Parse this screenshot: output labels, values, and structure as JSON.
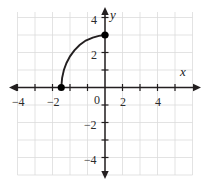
{
  "figure": {
    "name": "coordinate-plane-graph",
    "width": 210,
    "height": 184,
    "background": "#ffffff",
    "axis_color": "#231f20",
    "grid_color": "#d9d9d9",
    "curve_color": "#231f20",
    "point_color": "#000000"
  },
  "axes": {
    "x_label": "x",
    "y_label": "y",
    "x_ticks": [
      {
        "value": -4,
        "label": "−4"
      },
      {
        "value": -2,
        "label": "−2"
      },
      {
        "value": 2,
        "label": "2"
      },
      {
        "value": 4,
        "label": "4"
      }
    ],
    "y_ticks": [
      {
        "value": 4,
        "label": "4"
      },
      {
        "value": 2,
        "label": "2"
      },
      {
        "value": -2,
        "label": "−2"
      },
      {
        "value": -4,
        "label": "−4"
      }
    ],
    "origin_label": "0"
  },
  "chart_data": {
    "type": "line",
    "title": "",
    "xlabel": "x",
    "ylabel": "y",
    "xlim": [
      -5.4,
      5.4
    ],
    "ylim": [
      -5.4,
      4.5
    ],
    "grid": true,
    "grid_step": 1,
    "tick_step": 1,
    "labeled_tick_step": 2,
    "legend": "none",
    "series": [
      {
        "name": "curve",
        "description": "increasing concave-down curve from (-2.5, 0) to (0, 3)",
        "x": [
          -2.5,
          -2.45,
          -2.35,
          -2.2,
          -2.0,
          -1.75,
          -1.45,
          -1.1,
          -0.7,
          -0.35,
          0.0
        ],
        "y": [
          0.0,
          0.55,
          1.0,
          1.4,
          1.78,
          2.12,
          2.43,
          2.68,
          2.85,
          2.95,
          3.0
        ]
      }
    ],
    "points": [
      {
        "name": "left-endpoint",
        "x": -2.5,
        "y": 0,
        "style": "filled-circle"
      },
      {
        "name": "right-endpoint",
        "x": 0,
        "y": 3,
        "style": "filled-circle"
      }
    ]
  }
}
